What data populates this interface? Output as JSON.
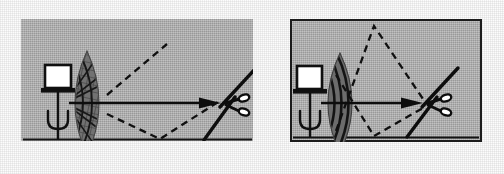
{
  "figure": {
    "kind": "two-panel technical line diagram",
    "background_color": "#fcfcfc",
    "panel_fill_color": "#a9a9a9",
    "ink_color": "#111111",
    "width": 504,
    "height": 174
  },
  "panels": [
    {
      "id": "left",
      "name": "diffuse-scattered-propagation",
      "label": "",
      "has_border": false,
      "border_color": "",
      "x": 21,
      "y": 19,
      "width": 232,
      "height": 122,
      "ground_line": {
        "present": true,
        "x1": 23,
        "y1": 121,
        "x2": 231,
        "y2": 121,
        "description": "solid horizontal ground / sea-surface line along the bottom"
      },
      "transmitter": {
        "name": "transmitter-on-mast",
        "box_label": "",
        "box_fill": "#ffffff",
        "x": 24,
        "y": 47,
        "width": 26,
        "height": 24,
        "platform": "horizontal bar beneath the box",
        "mast": "vertical stem descending to the ground line",
        "antenna_symbol": "trident",
        "description": "white square radiator box on a pedestal with a trident-shaped antenna below"
      },
      "wavefront": {
        "name": "wavefront-lens",
        "shape": "lens / lenticular (vesica) lobe",
        "pattern": "cross-hatched mesh of radial spokes and arcs",
        "style": "diffuse-scattered",
        "fill": "#6f6f6f",
        "center_x": 66,
        "center_y": 84,
        "half_width": 22,
        "half_height": 52
      },
      "direct_path": {
        "name": "direct-path-arrow",
        "style": "solid arrow",
        "x1": 48,
        "y1": 84,
        "x2": 190,
        "y2": 84,
        "description": "solid horizontal arrow from transmitter to target"
      },
      "multipath": [
        {
          "name": "upper-scatter-ray",
          "style": "dashed",
          "terminates_at_target": false,
          "points": "88,78 145,26",
          "description": "dashed ray scattering upward that never reaches the target"
        },
        {
          "name": "lower-ground-bounce-ray",
          "style": "dashed",
          "terminates_at_target": false,
          "points": "88,96 140,121 196,84",
          "description": "dashed ray reflecting off the ground line toward the target"
        }
      ],
      "target": {
        "name": "scissors-target",
        "symbol": "scissors",
        "x": 186,
        "y": 58,
        "width": 48,
        "height": 58,
        "description": "open scissors: two crossed blades with two small oval finger rings"
      }
    },
    {
      "id": "right",
      "name": "focused-beam-propagation",
      "label": "",
      "has_border": true,
      "border_color": "#1b1b1b",
      "x": 290,
      "y": 19,
      "width": 192,
      "height": 123,
      "ground_line": {
        "present": true,
        "x1": 2,
        "y1": 119,
        "x2": 190,
        "y2": 119,
        "description": "solid horizontal ground / sea-surface line along the bottom"
      },
      "transmitter": {
        "name": "transmitter-on-mast",
        "box_label": "",
        "box_fill": "#ffffff",
        "x": 7,
        "y": 48,
        "width": 25,
        "height": 24,
        "platform": "horizontal bar beneath the box",
        "mast": "vertical stem descending to the ground line",
        "antenna_symbol": "trident",
        "description": "white square radiator box on a pedestal with a trident-shaped antenna below"
      },
      "wavefront": {
        "name": "wavefront-lens",
        "shape": "lens / lenticular (vesica) lobe",
        "pattern": "smooth concentric arcs",
        "style": "focused-coherent",
        "fill": "#6f6f6f",
        "center_x": 50,
        "center_y": 84,
        "half_width": 20,
        "half_height": 48
      },
      "direct_path": {
        "name": "direct-path-arrow",
        "style": "solid arrow",
        "x1": 32,
        "y1": 84,
        "x2": 122,
        "y2": 84,
        "description": "solid horizontal arrow from transmitter to target"
      },
      "multipath": [
        {
          "name": "upper-multipath-ray",
          "style": "dashed",
          "terminates_at_target": true,
          "points": "46,112 84,8 131,80",
          "description": "dashed ray rising to an apex then descending onto the target"
        },
        {
          "name": "lower-multipath-ray",
          "style": "dashed",
          "terminates_at_target": true,
          "points": "46,56 84,118 131,88",
          "description": "dashed ray dipping to a low vertex then rising onto the target"
        }
      ],
      "target": {
        "name": "scissors-target",
        "symbol": "scissors",
        "x": 118,
        "y": 56,
        "width": 46,
        "height": 56,
        "description": "open scissors: two crossed blades with two small oval finger rings"
      }
    }
  ]
}
